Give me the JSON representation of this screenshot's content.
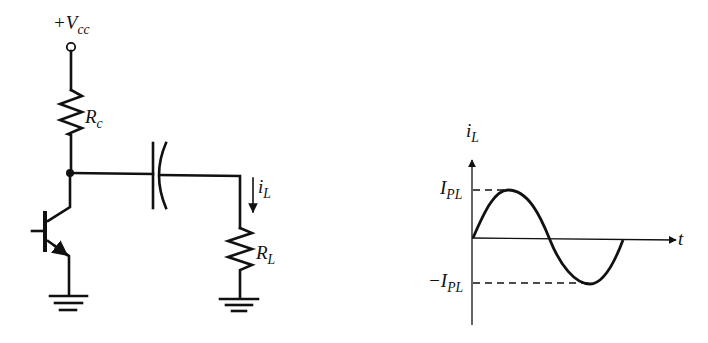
{
  "circuit": {
    "supply_label": "+V",
    "supply_sub": "cc",
    "collector_resistor_label": "R",
    "collector_resistor_sub": "c",
    "load_resistor_label": "R",
    "load_resistor_sub": "L",
    "load_current_label": "i",
    "load_current_sub": "L",
    "components": [
      "supply-terminal",
      "collector-resistor",
      "npn-transistor",
      "coupling-capacitor",
      "load-resistor",
      "ground-emitter",
      "ground-load",
      "current-arrow"
    ]
  },
  "waveform": {
    "y_axis_label": "i",
    "y_axis_sub": "L",
    "x_axis_label": "t",
    "peak_label": "I",
    "peak_sub": "PL",
    "trough_label": "−I",
    "trough_sub": "PL",
    "shape": "sine, one full cycle starting at origin"
  },
  "colors": {
    "ink": "#111111",
    "background": "#ffffff"
  }
}
